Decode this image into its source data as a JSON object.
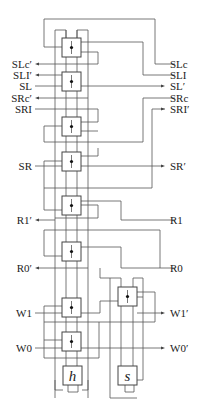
{
  "diagram": {
    "type": "circuit-schematic",
    "left_labels": [
      {
        "id": "slc-out",
        "text": "SLc′",
        "y": 64,
        "dir": "out"
      },
      {
        "id": "sli-out",
        "text": "SLI′",
        "y": 75,
        "dir": "out"
      },
      {
        "id": "sl-in",
        "text": "SL",
        "y": 86,
        "dir": "in"
      },
      {
        "id": "src-out",
        "text": "SRc′",
        "y": 98,
        "dir": "out"
      },
      {
        "id": "sri-in",
        "text": "SRI",
        "y": 109,
        "dir": "in"
      },
      {
        "id": "sr-in",
        "text": "SR",
        "y": 166,
        "dir": "in"
      },
      {
        "id": "r1-out",
        "text": "R1′",
        "y": 220,
        "dir": "out"
      },
      {
        "id": "r0-out",
        "text": "R0′",
        "y": 268,
        "dir": "out"
      },
      {
        "id": "w1-in",
        "text": "W1",
        "y": 313,
        "dir": "in"
      },
      {
        "id": "w0-in",
        "text": "W0",
        "y": 348,
        "dir": "in"
      }
    ],
    "right_labels": [
      {
        "id": "slc-in",
        "text": "SLc",
        "y": 64,
        "dir": "in"
      },
      {
        "id": "sli-in",
        "text": "SLI",
        "y": 75,
        "dir": "in"
      },
      {
        "id": "sl-out",
        "text": "SL′",
        "y": 86,
        "dir": "out"
      },
      {
        "id": "src-in",
        "text": "SRc",
        "y": 98,
        "dir": "in"
      },
      {
        "id": "sri-out",
        "text": "SRI′",
        "y": 109,
        "dir": "out"
      },
      {
        "id": "sr-out",
        "text": "SR′",
        "y": 166,
        "dir": "out"
      },
      {
        "id": "r1-in",
        "text": "R1",
        "y": 220,
        "dir": "in"
      },
      {
        "id": "r0-in",
        "text": "R0",
        "y": 268,
        "dir": "in"
      },
      {
        "id": "w1-out",
        "text": "W1′",
        "y": 313,
        "dir": "out"
      },
      {
        "id": "w0-out",
        "text": "W0′",
        "y": 348,
        "dir": "out"
      }
    ],
    "cells": [
      {
        "id": "cell-1",
        "x": 62,
        "y": 38,
        "w": 19,
        "h": 19
      },
      {
        "id": "cell-2",
        "x": 62,
        "y": 72,
        "w": 19,
        "h": 19
      },
      {
        "id": "cell-3",
        "x": 62,
        "y": 117,
        "w": 19,
        "h": 19
      },
      {
        "id": "cell-4",
        "x": 62,
        "y": 152,
        "w": 19,
        "h": 19
      },
      {
        "id": "cell-5",
        "x": 62,
        "y": 196,
        "w": 19,
        "h": 19
      },
      {
        "id": "cell-6",
        "x": 62,
        "y": 242,
        "w": 19,
        "h": 19
      },
      {
        "id": "cell-7",
        "x": 62,
        "y": 298,
        "w": 19,
        "h": 19
      },
      {
        "id": "cell-8",
        "x": 62,
        "y": 332,
        "w": 19,
        "h": 19
      },
      {
        "id": "cell-9",
        "x": 118,
        "y": 287,
        "w": 19,
        "h": 19
      }
    ],
    "terminal_boxes": [
      {
        "id": "h-box",
        "glyph": "h",
        "x": 63,
        "y": 366,
        "w": 19,
        "h": 19
      },
      {
        "id": "s-box",
        "glyph": "s",
        "x": 118,
        "y": 366,
        "w": 19,
        "h": 19
      }
    ],
    "colors": {
      "wire": "#555555",
      "box": "#444444",
      "text": "#222222",
      "background": "#ffffff"
    }
  }
}
